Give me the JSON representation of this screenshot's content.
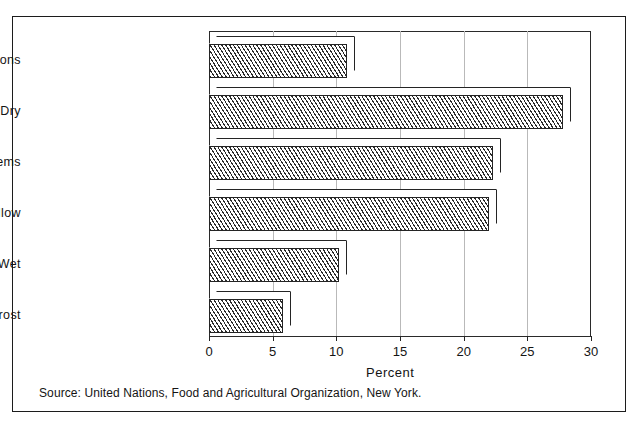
{
  "chart_data": {
    "type": "bar",
    "orientation": "horizontal",
    "title": "",
    "subtitle": "",
    "xlabel": "Percent",
    "ylabel": "",
    "categories": [
      "No limitations",
      "Too Dry",
      "Chemical Problems",
      "Soil Too Shallow",
      "Too Wet",
      "Permafrost"
    ],
    "values": [
      10.8,
      27.8,
      22.3,
      22.0,
      10.2,
      5.8
    ],
    "xlim": [
      0,
      30
    ],
    "xticks": [
      0,
      5,
      10,
      15,
      20,
      25,
      30
    ],
    "xticklabels": [
      "0",
      "5",
      "10",
      "15",
      "20",
      "25",
      "30"
    ],
    "grid": true,
    "grid_axis": "x",
    "legend": null,
    "style": "3d-hatched-bars",
    "bar_fill": "diagonal-hatch",
    "colors": {
      "bar_outline": "#242424",
      "hatch": "#2b2b2b",
      "background": "#ffffff",
      "gridline": "#b9b9b9",
      "frame": "#1c1c1c",
      "text": "#141414"
    }
  },
  "footer": {
    "source": "Source: United Nations, Food and Agricultural Organization, New York."
  }
}
